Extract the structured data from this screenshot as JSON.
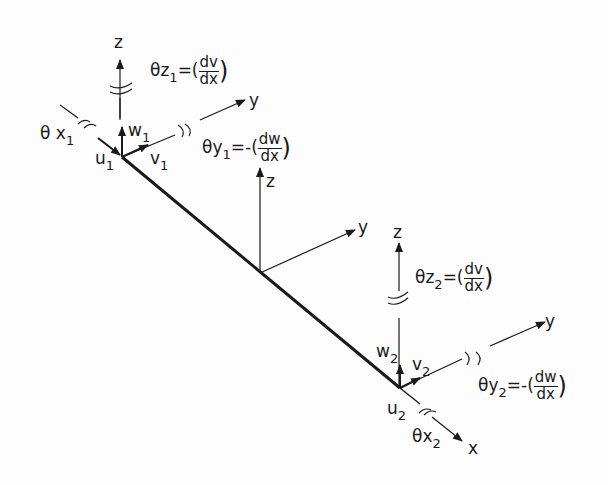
{
  "figure": {
    "line_color": "#1a1a1a",
    "background": "#fdfdfd"
  },
  "global_axes": {
    "z": "z",
    "y": "y"
  },
  "node1": {
    "axis_z": "z",
    "axis_y": "y",
    "translations": {
      "u": "u",
      "u_sub": "1",
      "v": "v",
      "v_sub": "1",
      "w": "w",
      "w_sub": "1"
    },
    "rotations": {
      "theta_x": {
        "symbol": "θ",
        "axis": "x",
        "sub": "1"
      },
      "theta_y": {
        "symbol": "θ",
        "axis": "y",
        "sub": "1",
        "eq": "=-(",
        "num": "dw",
        "den": "dx",
        "close": ")"
      },
      "theta_z": {
        "symbol": "θ",
        "axis": "z",
        "sub": "1",
        "eq": "=(",
        "num": "dv",
        "den": "dx",
        "close": ")"
      }
    }
  },
  "node2": {
    "axis_z": "z",
    "axis_y": "y",
    "axis_x": "x",
    "translations": {
      "u": "u",
      "u_sub": "2",
      "v": "v",
      "v_sub": "2",
      "w": "w",
      "w_sub": "2"
    },
    "rotations": {
      "theta_x": {
        "symbol": "θ",
        "axis": "x",
        "sub": "2"
      },
      "theta_y": {
        "symbol": "θ",
        "axis": "y",
        "sub": "2",
        "eq": "=-(",
        "num": "dw",
        "den": "dx",
        "close": ")"
      },
      "theta_z": {
        "symbol": "θ",
        "axis": "z",
        "sub": "2",
        "eq": "=(",
        "num": "dv",
        "den": "dx",
        "close": ")"
      }
    }
  }
}
